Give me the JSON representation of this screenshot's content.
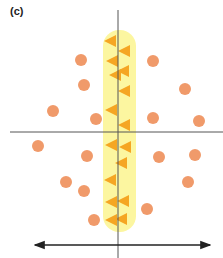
{
  "panel": {
    "label": "(c)"
  },
  "colors": {
    "circle": "#f09a6a",
    "triangle": "#f5a623",
    "band": "#fbf58f",
    "axis": "#555555",
    "arrow": "#222222"
  },
  "axes": {
    "vertical": {
      "x": 118,
      "y1": 10,
      "y2": 258
    },
    "horizontal": {
      "y": 132,
      "x1": 10,
      "x2": 223
    }
  },
  "band": {
    "x": 103,
    "y": 30,
    "width": 33,
    "height": 202,
    "radius": 16
  },
  "arrow": {
    "y": 245,
    "x1": 35,
    "x2": 210,
    "double_headed": true
  },
  "circles": [
    {
      "x": 81,
      "y": 60
    },
    {
      "x": 84,
      "y": 85
    },
    {
      "x": 53,
      "y": 111
    },
    {
      "x": 96,
      "y": 119
    },
    {
      "x": 153,
      "y": 61
    },
    {
      "x": 185,
      "y": 89
    },
    {
      "x": 153,
      "y": 118
    },
    {
      "x": 199,
      "y": 121
    },
    {
      "x": 38,
      "y": 146
    },
    {
      "x": 87,
      "y": 156
    },
    {
      "x": 66,
      "y": 182
    },
    {
      "x": 84,
      "y": 191
    },
    {
      "x": 94,
      "y": 220
    },
    {
      "x": 159,
      "y": 157
    },
    {
      "x": 195,
      "y": 155
    },
    {
      "x": 188,
      "y": 182
    },
    {
      "x": 147,
      "y": 209
    }
  ],
  "triangles": [
    {
      "x": 110,
      "y": 41
    },
    {
      "x": 124,
      "y": 51
    },
    {
      "x": 112,
      "y": 61
    },
    {
      "x": 123,
      "y": 71
    },
    {
      "x": 115,
      "y": 75
    },
    {
      "x": 124,
      "y": 91
    },
    {
      "x": 111,
      "y": 110
    },
    {
      "x": 124,
      "y": 125
    },
    {
      "x": 111,
      "y": 145
    },
    {
      "x": 125,
      "y": 147
    },
    {
      "x": 121,
      "y": 163
    },
    {
      "x": 110,
      "y": 180
    },
    {
      "x": 111,
      "y": 202
    },
    {
      "x": 123,
      "y": 201
    },
    {
      "x": 111,
      "y": 220
    },
    {
      "x": 121,
      "y": 219
    }
  ],
  "icons": {
    "circle": "circle-marker-icon",
    "triangle": "left-pointing-triangle-icon"
  }
}
